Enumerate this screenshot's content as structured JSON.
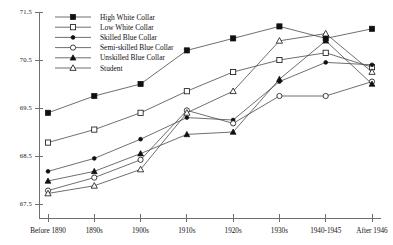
{
  "chart_data": {
    "type": "line",
    "title": "",
    "xlabel": "",
    "ylabel": "",
    "categories": [
      "Before 1890",
      "1890s",
      "1900s",
      "1910s",
      "1920s",
      "1930s",
      "1940-1945",
      "After 1946"
    ],
    "ylim": [
      67.2,
      71.5
    ],
    "yticks": [
      67.5,
      68.5,
      69.5,
      70.5,
      71.5
    ],
    "ytick_labels": [
      "67.5",
      "68.5",
      "69.5",
      "70.5",
      "71.5"
    ],
    "grid": false,
    "legend_position": "top-left",
    "series": [
      {
        "name": "High White Collar",
        "marker": "filled-square",
        "values": [
          69.4,
          69.75,
          70.0,
          70.7,
          70.95,
          71.2,
          70.95,
          71.15
        ]
      },
      {
        "name": "Low White Collar",
        "marker": "open-square",
        "values": [
          68.78,
          69.05,
          69.4,
          69.85,
          70.25,
          70.5,
          70.65,
          70.35
        ]
      },
      {
        "name": "Skilled Blue Collar",
        "marker": "small-filled-dot",
        "values": [
          68.18,
          68.45,
          68.85,
          69.3,
          69.25,
          70.05,
          70.45,
          70.4
        ]
      },
      {
        "name": "Semi-skilled Blue Collar",
        "marker": "open-circle",
        "values": [
          67.78,
          68.05,
          68.42,
          69.45,
          69.18,
          69.75,
          69.75,
          70.05
        ]
      },
      {
        "name": "Unskilled Blue Collar",
        "marker": "filled-triangle",
        "values": [
          67.98,
          68.18,
          68.55,
          68.95,
          69.0,
          70.1,
          70.9,
          70.0
        ]
      },
      {
        "name": "Student",
        "marker": "open-triangle",
        "values": [
          67.72,
          67.88,
          68.22,
          69.4,
          69.85,
          70.9,
          71.05,
          70.25
        ]
      }
    ]
  },
  "legend": {
    "items": [
      {
        "label": "High White Collar",
        "marker": "filled-square"
      },
      {
        "label": "Low White Collar",
        "marker": "open-square"
      },
      {
        "label": "Skilled Blue Collar",
        "marker": "small-filled-dot"
      },
      {
        "label": "Semi-skilled Blue Collar",
        "marker": "open-circle"
      },
      {
        "label": "Unskilled Blue Collar",
        "marker": "filled-triangle"
      },
      {
        "label": "Student",
        "marker": "open-triangle"
      }
    ]
  },
  "colors": {
    "line": "#4a4a4a",
    "axis": "#6f6f6f",
    "marker": "#101010",
    "background": "#ffffff"
  }
}
